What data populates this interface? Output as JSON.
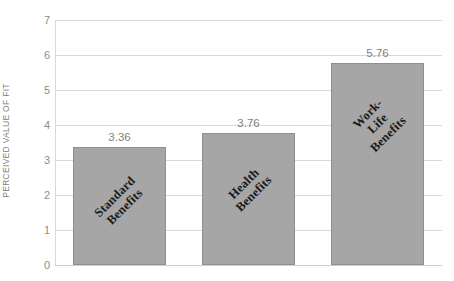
{
  "chart_data": {
    "type": "bar",
    "title": "",
    "xlabel": "",
    "ylabel": "PERCEIVED VALUE OF FIT",
    "categories": [
      "Standard Benefits",
      "Health Benefits",
      "Work-Life Benefits"
    ],
    "values": [
      3.36,
      3.76,
      5.76
    ],
    "value_labels": [
      "3.36",
      "3.76",
      "5.76"
    ],
    "ylim": [
      0,
      7
    ],
    "yticks": [
      7,
      6,
      5,
      4,
      3,
      2,
      1,
      0
    ],
    "ytick_labels": [
      "7",
      "6",
      "5",
      "4",
      "3",
      "2",
      "1",
      "0"
    ],
    "grid": true,
    "legend": "none",
    "bar_color": "#a6a6a6",
    "bar_border_color": "#8f8f8f",
    "gridline_color": "#d9d9d9",
    "tick_label_color": "#8c8c8c",
    "axis_title_color": "#808080",
    "value_label_color": "#7f7f7f",
    "bar_label_color": "#1a1a1a",
    "bar_label_rotation": "-45",
    "bars": [
      {
        "category_line1": "Standard",
        "category_line2": "Benefits",
        "value": 3.36,
        "value_label": "3.36"
      },
      {
        "category_line1": "Health",
        "category_line2": "Benefits",
        "value": 3.76,
        "value_label": "3.76"
      },
      {
        "category_line1": "Work-Life",
        "category_line2": "Benefits",
        "value": 5.76,
        "value_label": "5.76"
      }
    ]
  }
}
